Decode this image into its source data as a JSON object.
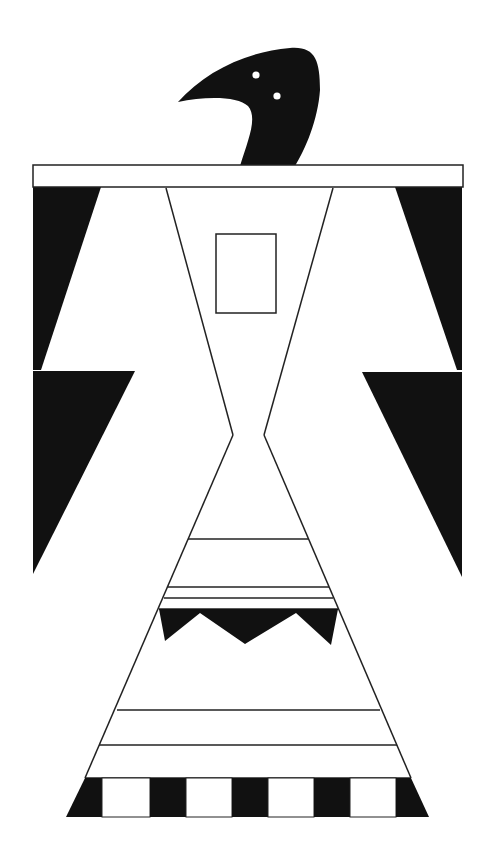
{
  "artwork": {
    "title": "Thunderbird geometric design",
    "colors": {
      "background": "#ffffff",
      "fill": "#111111",
      "line": "#222222",
      "eye": "#ffffff"
    },
    "parts": [
      "head",
      "eyes",
      "top-bar",
      "left-wing",
      "right-wing",
      "body",
      "chest-rectangle",
      "skirt-bands",
      "zigzag-band",
      "checker-band"
    ]
  }
}
